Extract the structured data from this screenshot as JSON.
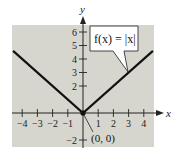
{
  "chart_data": {
    "type": "line",
    "title": "",
    "xlabel": "x",
    "ylabel": "y",
    "xlim": [
      -4.6,
      4.6
    ],
    "ylim": [
      -2.5,
      6.5
    ],
    "x_ticks": [
      -4,
      -3,
      -2,
      -1,
      1,
      2,
      3,
      4
    ],
    "y_ticks": [
      -2,
      2,
      3,
      4,
      5,
      6
    ],
    "x_tick_labels": [
      "−4",
      "−3",
      "−2",
      "−1",
      "1",
      "2",
      "3",
      "4"
    ],
    "y_tick_labels": [
      "−2",
      "2",
      "3",
      "4",
      "5",
      "6"
    ],
    "grid": false,
    "series": [
      {
        "name": "f(x) = |x|",
        "x": [
          -4.6,
          0,
          4.6
        ],
        "y": [
          4.6,
          0,
          4.6
        ]
      }
    ],
    "annotations": [
      {
        "text": "f(x) = |x|",
        "type": "callout",
        "points_to": [
          3,
          3
        ]
      },
      {
        "text": "(0, 0)",
        "type": "point-label",
        "points_to": [
          0,
          0
        ]
      }
    ],
    "highlight_points": [
      [
        0,
        0
      ]
    ],
    "background": "#d6d6ce",
    "line_color": "#111111"
  },
  "labels": {
    "x_axis": "x",
    "y_axis": "y",
    "callout": "f(x) = |x|",
    "origin": "(0, 0)"
  }
}
